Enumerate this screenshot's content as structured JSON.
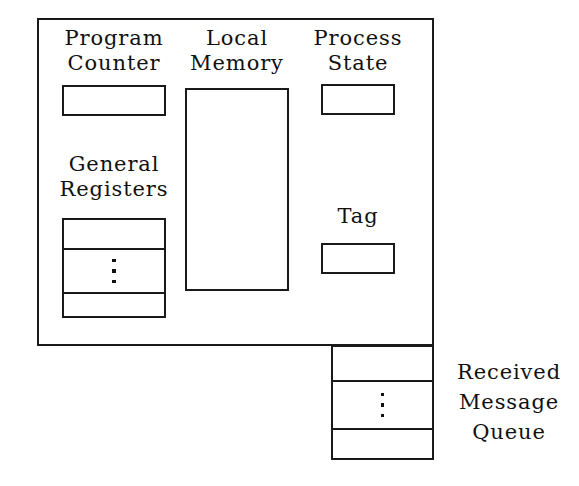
{
  "diagram": {
    "background_color": "#ffffff",
    "line_color": "#1a1a1a",
    "text_color": "#111111"
  },
  "node": {
    "program_counter": {
      "label_line1": "Program",
      "label_line2": "Counter",
      "value": ""
    },
    "local_memory": {
      "label_line1": "Local",
      "label_line2": "Memory",
      "value": ""
    },
    "process_state": {
      "label_line1": "Process",
      "label_line2": "State",
      "value": ""
    },
    "general_registers": {
      "label_line1": "General",
      "label_line2": "Registers",
      "cells": [
        {
          "value": ""
        },
        {
          "value": "⋮"
        },
        {
          "value": ""
        }
      ]
    },
    "tag": {
      "label_line1": "Tag",
      "value": ""
    }
  },
  "received_message_queue": {
    "label_line1": "Received",
    "label_line2": "Message",
    "label_line3": "Queue",
    "cells": [
      {
        "value": ""
      },
      {
        "value": "⋮"
      },
      {
        "value": ""
      }
    ]
  }
}
